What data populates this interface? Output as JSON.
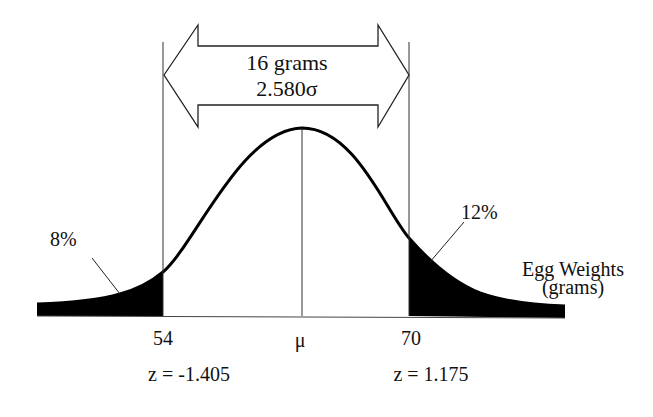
{
  "diagram": {
    "type": "normal-distribution",
    "span_label": {
      "line1": "16 grams",
      "line2": "2.580σ"
    },
    "left_tail": {
      "percent_label": "8%",
      "value_label": "54",
      "z_label": "z = -1.405"
    },
    "right_tail": {
      "percent_label": "12%",
      "value_label": "70",
      "z_label": "z = 1.175"
    },
    "mean_label": "μ",
    "axis_label": {
      "line1": "Egg Weights",
      "line2": "(grams)"
    },
    "colors": {
      "ink": "#111111",
      "fill": "#000000",
      "background": "#ffffff"
    }
  }
}
